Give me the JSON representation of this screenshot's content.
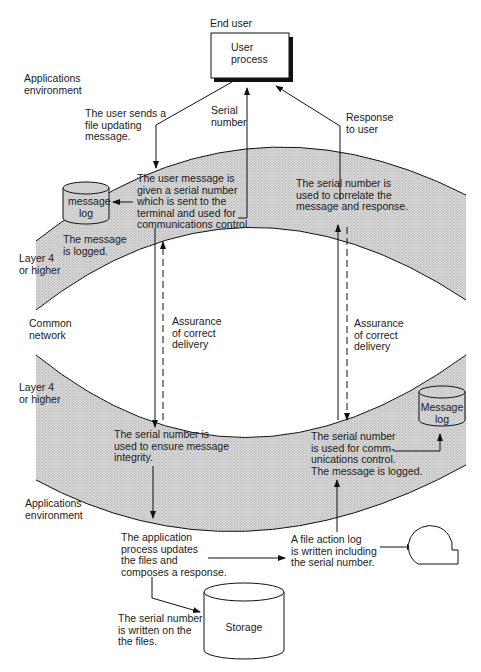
{
  "diagram": {
    "colors": {
      "band_fill": "#d2d2d2",
      "line": "#111111",
      "background": "#ffffff"
    },
    "nodes": {
      "end_user_label": "End user",
      "user_process": "User\nprocess",
      "message_log_top": "message\nlog",
      "message_log_bottom": "Message\nlog",
      "storage": "Storage",
      "file_action_log_symbol": "file-action-log-icon"
    },
    "zones": {
      "apps_env_top": "Applications\nenvironment",
      "layer4_top": "Layer 4\nor higher",
      "common_network": "Common\nnetwork",
      "layer4_bottom": "Layer 4\nor higher",
      "apps_env_bottom": "Applications\nenvironment"
    },
    "annotations": {
      "user_sends": "The user sends a\nfile updating\nmessage.",
      "serial_number": "Serial\nnumber",
      "response_to_user": "Response\nto user",
      "user_message_given": "The user message is\ngiven a serial number\nwhich is sent to the\nterminal and used for\ncommunications control.",
      "message_logged_top": "The message\nis logged.",
      "correlate": "The serial number is\nused to correlate the\nmessage and response.",
      "assurance_left": "Assurance\nof correct\ndelivery",
      "assurance_right": "Assurance\nof correct\ndelivery",
      "ensure_integrity": "The serial number is\nused to ensure message\nintegrity.",
      "comm_control_bottom": "The serial number\nis used for comm-\nunications control.\nThe message is logged.",
      "app_updates": "The application\nprocess updates\nthe files and\ncomposes a response.",
      "file_action_log": "A file action log\nis written including\nthe serial number.",
      "written_on_files": "The serial number\nis written on the\nthe files."
    }
  }
}
